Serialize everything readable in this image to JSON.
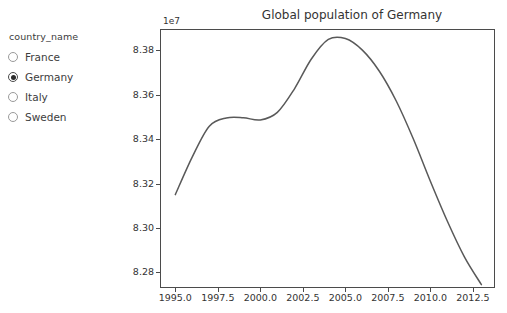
{
  "controls": {
    "group_label": "country_name",
    "options": [
      {
        "label": "France",
        "selected": false
      },
      {
        "label": "Germany",
        "selected": true
      },
      {
        "label": "Italy",
        "selected": false
      },
      {
        "label": "Sweden",
        "selected": false
      }
    ]
  },
  "figure": {
    "title": "Global population of Germany",
    "y_offset_text": "1e7",
    "line_color": "#595959",
    "frame_color": "#4b4b4b"
  },
  "chart_data": {
    "type": "line",
    "title": "Global population of Germany",
    "xlabel": "",
    "ylabel": "",
    "y_offset": "1e7",
    "grid": false,
    "legend": null,
    "xlim": [
      1994.1,
      2013.8
    ],
    "ylim": [
      82730000,
      83895000
    ],
    "xticks": [
      1995.0,
      1997.5,
      2000.0,
      2002.5,
      2005.0,
      2007.5,
      2010.0,
      2012.5
    ],
    "xticklabels": [
      "1995.0",
      "1997.5",
      "2000.0",
      "2002.5",
      "2005.0",
      "2007.5",
      "2010.0",
      "2012.5"
    ],
    "yticks": [
      82800000,
      83000000,
      83200000,
      83400000,
      83600000,
      83800000
    ],
    "yticklabels": [
      "8.28",
      "8.30",
      "8.32",
      "8.34",
      "8.36",
      "8.38"
    ],
    "series": [
      {
        "name": "Germany",
        "color": "#595959",
        "x": [
          1995,
          1996,
          1997,
          1998,
          1999,
          2000,
          2001,
          2002,
          2003,
          2004,
          2005,
          2006,
          2007,
          2008,
          2009,
          2010,
          2011,
          2012,
          2013
        ],
        "y": [
          83150000,
          83320000,
          83458000,
          83495000,
          83496000,
          83486000,
          83520000,
          83625000,
          83760000,
          83848000,
          83852000,
          83800000,
          83705000,
          83570000,
          83400000,
          83210000,
          83030000,
          82870000,
          82745000
        ]
      }
    ]
  }
}
